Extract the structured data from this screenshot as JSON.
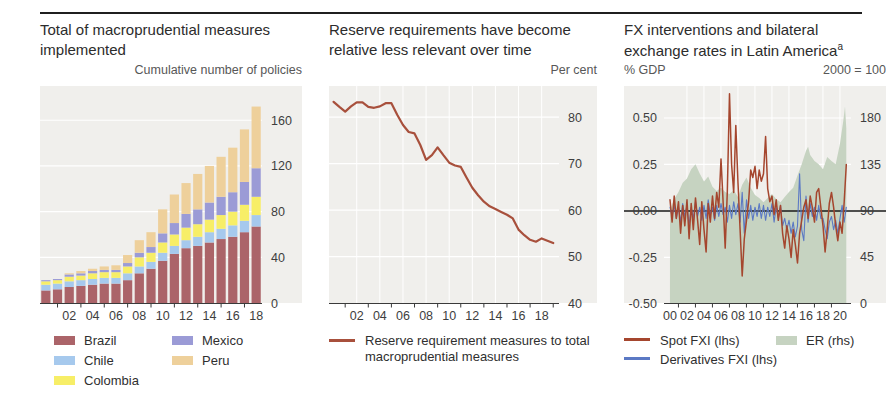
{
  "colors": {
    "plot_bg": "#f0efec",
    "grid": "#ffffff",
    "axis": "#3a3a3a",
    "zero_line": "#1a1a1a",
    "text": "#3e3e3e"
  },
  "chart_data": [
    {
      "type": "bar",
      "title": "Total of macroprudential measures implemented",
      "unit_label": "Cumulative number of policies",
      "categories": [
        "00",
        "01",
        "02",
        "03",
        "04",
        "05",
        "06",
        "07",
        "08",
        "09",
        "10",
        "11",
        "12",
        "13",
        "14",
        "15",
        "16",
        "17",
        "18"
      ],
      "series": [
        {
          "name": "Brazil",
          "color": "#ab6469",
          "values": [
            11,
            12,
            14,
            15,
            16,
            17,
            17,
            20,
            26,
            30,
            37,
            43,
            48,
            50,
            53,
            56,
            58,
            62,
            67
          ]
        },
        {
          "name": "Chile",
          "color": "#a6c9ed",
          "values": [
            5,
            5,
            5,
            5,
            5,
            5,
            5,
            6,
            6,
            6,
            7,
            7,
            7,
            8,
            9,
            9,
            10,
            10,
            10
          ]
        },
        {
          "name": "Colombia",
          "color": "#f7ee67",
          "values": [
            3,
            3,
            4,
            4,
            5,
            5,
            5,
            6,
            8,
            8,
            9,
            10,
            11,
            11,
            11,
            12,
            12,
            14,
            16
          ]
        },
        {
          "name": "Mexico",
          "color": "#9b9bd6",
          "values": [
            1,
            1,
            2,
            2,
            2,
            2,
            2,
            3,
            4,
            5,
            8,
            10,
            12,
            13,
            15,
            16,
            17,
            20,
            25
          ]
        },
        {
          "name": "Peru",
          "color": "#eed09b",
          "values": [
            0,
            0,
            1,
            2,
            2,
            3,
            4,
            7,
            11,
            13,
            21,
            25,
            27,
            31,
            32,
            35,
            39,
            46,
            54
          ]
        }
      ],
      "ylim": [
        0,
        190
      ],
      "grid_y": [
        40,
        80,
        120,
        160
      ],
      "yticks_right": [
        [
          160,
          "160"
        ],
        [
          120,
          "120"
        ],
        [
          80,
          "80"
        ],
        [
          40,
          "40"
        ],
        [
          0,
          "0"
        ]
      ],
      "xtick_labels": [
        [
          2,
          "02"
        ],
        [
          4,
          "04"
        ],
        [
          6,
          "06"
        ],
        [
          8,
          "08"
        ],
        [
          10,
          "10"
        ],
        [
          12,
          "12"
        ],
        [
          14,
          "14"
        ],
        [
          16,
          "16"
        ],
        [
          18,
          "18"
        ]
      ],
      "xtick_marks": [
        1,
        3,
        5,
        7,
        9,
        11,
        13,
        15,
        17
      ],
      "legend_position": "below"
    },
    {
      "type": "line",
      "title": "Reserve requirements have become relative less relevant over time",
      "unit_label": "Per cent",
      "xlim": [
        1999.6,
        2019.5
      ],
      "ylim": [
        40,
        86.7
      ],
      "grid_y": [
        50,
        60,
        70,
        80
      ],
      "grid_x": [
        2002,
        2004,
        2006,
        2008,
        2010,
        2012,
        2014,
        2016,
        2018
      ],
      "yticks_right": [
        [
          80,
          "80"
        ],
        [
          70,
          "70"
        ],
        [
          60,
          "60"
        ],
        [
          50,
          "50"
        ],
        [
          40,
          "40"
        ]
      ],
      "xtick_labels": [
        [
          2002,
          "02"
        ],
        [
          2004,
          "04"
        ],
        [
          2006,
          "06"
        ],
        [
          2008,
          "08"
        ],
        [
          2010,
          "10"
        ],
        [
          2012,
          "12"
        ],
        [
          2014,
          "14"
        ],
        [
          2016,
          "16"
        ],
        [
          2018,
          "18"
        ]
      ],
      "xtick_marks": [
        2001,
        2003,
        2005,
        2007,
        2009,
        2011,
        2013,
        2015,
        2017,
        2019
      ],
      "series": [
        {
          "name": "Reserve requirement measures to total macroprudential measures",
          "color": "#a8503c",
          "width": 2.2,
          "x_start": 2000,
          "x_step": 0.5,
          "values": [
            83.3,
            82.2,
            81.2,
            82.3,
            83.2,
            83.2,
            82.2,
            82.0,
            82.3,
            83.0,
            83.0,
            80.5,
            78.3,
            76.8,
            76.5,
            74.0,
            70.8,
            71.8,
            73.5,
            71.8,
            70.2,
            69.6,
            69.3,
            67.0,
            64.8,
            63.2,
            61.8,
            60.8,
            60.2,
            59.6,
            59.0,
            58.2,
            55.8,
            54.6,
            53.6,
            53.2,
            53.9,
            53.4,
            52.9
          ]
        }
      ],
      "legend_position": "below"
    },
    {
      "type": "fxi",
      "title": "FX interventions and bilateral exchange rates in Latin America",
      "title_sup": "a",
      "unit_label_left": "% GDP",
      "unit_label_right": "2000 = 100",
      "xlim": [
        1999.3,
        2021.3
      ],
      "ylim": [
        -0.495,
        0.672
      ],
      "ylim_rhs": [
        0,
        211
      ],
      "grid_y": [
        -0.25,
        0.25,
        0.5
      ],
      "grid_x": [
        2002,
        2004,
        2006,
        2008,
        2010,
        2012,
        2014,
        2016,
        2018,
        2020
      ],
      "yticks_left": [
        [
          0.5,
          "0.50"
        ],
        [
          0.25,
          "0.25"
        ],
        [
          0,
          "0.00"
        ],
        [
          -0.25,
          "-0.25"
        ],
        [
          -0.5,
          "-0.50"
        ]
      ],
      "yticks_right": [
        [
          180,
          "180"
        ],
        [
          135,
          "135"
        ],
        [
          90,
          "90"
        ],
        [
          45,
          "45"
        ],
        [
          0,
          "0"
        ]
      ],
      "xtick_labels": [
        [
          2000,
          "00"
        ],
        [
          2002,
          "02"
        ],
        [
          2004,
          "04"
        ],
        [
          2006,
          "06"
        ],
        [
          2008,
          "08"
        ],
        [
          2010,
          "10"
        ],
        [
          2012,
          "12"
        ],
        [
          2014,
          "14"
        ],
        [
          2016,
          "16"
        ],
        [
          2018,
          "18"
        ],
        [
          2020,
          "20"
        ]
      ],
      "xtick_marks": [
        2001,
        2003,
        2005,
        2007,
        2009,
        2011,
        2013,
        2015,
        2017,
        2019
      ],
      "area": {
        "name": "ER (rhs)",
        "color": "#c6d3c1",
        "x": [
          2000,
          2000.5,
          2001,
          2001.5,
          2002,
          2002.5,
          2003,
          2003.5,
          2004,
          2004.5,
          2005,
          2005.5,
          2006,
          2006.5,
          2007,
          2007.5,
          2008,
          2008.5,
          2009,
          2009.5,
          2010,
          2010.5,
          2011,
          2011.5,
          2012,
          2012.5,
          2013,
          2013.5,
          2014,
          2014.5,
          2015,
          2015.5,
          2016,
          2016.25,
          2016.5,
          2017,
          2017.5,
          2018,
          2018.5,
          2019,
          2019.5,
          2020,
          2020.4,
          2020.6,
          2020.75
        ],
        "values": [
          90,
          101,
          108,
          117,
          121,
          130,
          135,
          126,
          118,
          123,
          113,
          109,
          112,
          108,
          106,
          110,
          103,
          115,
          122,
          112,
          105,
          102,
          98,
          102,
          106,
          101,
          98,
          103,
          108,
          112,
          124,
          135,
          148,
          152,
          144,
          138,
          135,
          130,
          142,
          138,
          135,
          155,
          178,
          191,
          170
        ]
      },
      "series": [
        {
          "name": "Derivatives FXI (lhs)",
          "color": "#5b79c4",
          "width": 1.1,
          "x_start": 2000,
          "x_step": 0.25,
          "values": [
            0.02,
            -0.03,
            0.03,
            -0.04,
            0.02,
            -0.06,
            0.04,
            -0.03,
            0.03,
            -0.08,
            0.02,
            -0.04,
            0.05,
            -0.03,
            0.02,
            -0.05,
            0.03,
            -0.04,
            0.06,
            -0.02,
            0.02,
            -0.05,
            0.03,
            -0.03,
            0.04,
            -0.02,
            0.02,
            -0.06,
            0.03,
            -0.04,
            0.05,
            -0.02,
            0.04,
            -0.06,
            0.1,
            -0.12,
            0.06,
            -0.04,
            0.03,
            -0.05,
            0.02,
            -0.03,
            0.04,
            -0.04,
            0.03,
            -0.05,
            0.02,
            -0.03,
            0.04,
            -0.06,
            0.02,
            -0.04,
            0.03,
            -0.08,
            -0.04,
            -0.1,
            -0.05,
            -0.12,
            -0.06,
            -0.14,
            -0.08,
            0.2,
            -0.1,
            -0.16,
            0.08,
            -0.06,
            0.04,
            -0.03,
            0.02,
            -0.05,
            0.03,
            -0.04,
            -0.04,
            -0.1,
            -0.15,
            -0.06,
            -0.03,
            -0.1,
            -0.05,
            -0.12,
            -0.04,
            0.03,
            -0.06,
            0.02
          ]
        },
        {
          "name": "Spot FXI (lhs)",
          "color": "#a5462e",
          "width": 1.5,
          "x_start": 2000,
          "x_step": 0.25,
          "values": [
            0.06,
            -0.06,
            0.08,
            -0.04,
            0.05,
            -0.12,
            0.03,
            -0.08,
            0.06,
            -0.15,
            0.04,
            -0.1,
            0.07,
            -0.05,
            -0.18,
            0.05,
            -0.1,
            -0.22,
            0.04,
            -0.06,
            0.08,
            -0.04,
            0.1,
            0.02,
            0.28,
            0.05,
            -0.2,
            0.1,
            0.63,
            0.25,
            0.1,
            0.46,
            0.15,
            -0.1,
            -0.35,
            -0.15,
            -0.05,
            0.05,
            0.22,
            0.18,
            0.24,
            0.12,
            0.22,
            0.16,
            0.2,
            0.4,
            0.12,
            0.05,
            0.08,
            -0.02,
            0.06,
            -0.05,
            0.03,
            -0.12,
            -0.2,
            -0.08,
            -0.15,
            -0.25,
            -0.1,
            -0.18,
            -0.28,
            -0.12,
            -0.05,
            0.02,
            0.06,
            -0.04,
            0.08,
            0.02,
            -0.06,
            0.1,
            0.12,
            0.02,
            -0.08,
            -0.22,
            -0.1,
            0.04,
            0.1,
            0.02,
            -0.08,
            -0.16,
            -0.06,
            -0.12,
            0.05,
            0.25
          ]
        }
      ],
      "legend_position": "below"
    }
  ]
}
